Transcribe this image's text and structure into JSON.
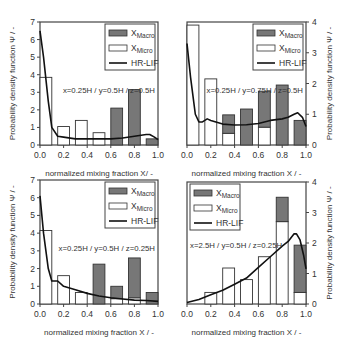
{
  "chart_data": [
    {
      "type": "bar",
      "panel": "top-left",
      "annotation": "x=0.25H / y=0.5H / z=0.5H",
      "xlabel": "normalized mixing fraction X/ -",
      "ylabel": "Probability density function Ψ / -",
      "y_axis_side": "left",
      "xlim": [
        0,
        1
      ],
      "ylim": [
        0,
        7
      ],
      "xticks": [
        "0.0",
        "0.2",
        "0.4",
        "0.6",
        "0.8",
        "1.0"
      ],
      "yticks": [
        "0",
        "1",
        "2",
        "3",
        "4",
        "5",
        "6",
        "7"
      ],
      "legend": [
        "XMacro",
        "XMicro",
        "HR-LIF"
      ],
      "legend_position": "top-right",
      "bin_centers": [
        0.05,
        0.2,
        0.35,
        0.5,
        0.65,
        0.8,
        0.95
      ],
      "series": [
        {
          "name": "XMicro",
          "values": [
            3.85,
            1.05,
            1.4,
            0.7,
            0,
            0,
            0
          ]
        },
        {
          "name": "XMacro",
          "values": [
            0,
            0,
            0,
            0,
            2.1,
            3.15,
            0.35
          ]
        },
        {
          "name": "HR-LIF",
          "x": [
            0,
            0.03,
            0.07,
            0.1,
            0.15,
            0.2,
            0.3,
            0.4,
            0.5,
            0.6,
            0.7,
            0.8,
            0.9,
            0.93,
            0.97,
            1.0
          ],
          "values": [
            6.5,
            5.0,
            2.5,
            1.0,
            0.5,
            0.45,
            0.35,
            0.35,
            0.35,
            0.35,
            0.4,
            0.5,
            0.6,
            0.6,
            0.45,
            0.3
          ]
        }
      ]
    },
    {
      "type": "bar",
      "panel": "top-right",
      "annotation": "x=0.25H / y=0.75H / z=0.5H",
      "xlabel": "normalized mixing fraction X / -",
      "ylabel": "Probability density function Ψ / -",
      "y_axis_side": "right",
      "xlim": [
        0,
        1
      ],
      "ylim": [
        0,
        4
      ],
      "xticks": [
        "0.0",
        "0.2",
        "0.4",
        "0.6",
        "0.8",
        "1.0"
      ],
      "yticks": [
        "0",
        "1",
        "2",
        "3",
        "4"
      ],
      "legend": [
        "XMacro",
        "XMicro",
        "HR-LIF"
      ],
      "legend_position": "top-right",
      "bin_centers": [
        0.05,
        0.2,
        0.35,
        0.5,
        0.65,
        0.8,
        0.95
      ],
      "series": [
        {
          "name": "XMicro",
          "values": [
            3.9,
            2.15,
            0.38,
            0,
            0.58,
            0,
            0
          ]
        },
        {
          "name": "XMacro",
          "values": [
            0,
            0,
            0.6,
            1.17,
            1.17,
            1.95,
            0.8
          ]
        },
        {
          "name": "HR-LIF",
          "x": [
            0,
            0.03,
            0.07,
            0.1,
            0.13,
            0.17,
            0.2,
            0.3,
            0.4,
            0.5,
            0.6,
            0.7,
            0.8,
            0.85,
            0.9,
            0.93,
            0.97,
            1.0
          ],
          "values": [
            3.3,
            2.2,
            1.0,
            0.75,
            0.75,
            0.85,
            0.8,
            0.68,
            0.65,
            0.66,
            0.7,
            0.8,
            0.85,
            0.9,
            1.0,
            1.05,
            0.9,
            0.6
          ]
        }
      ]
    },
    {
      "type": "bar",
      "panel": "bottom-left",
      "annotation": "x=0.25H / y=0.5H / z=0.25H",
      "xlabel": "normalized mixing fraction X / -",
      "ylabel": "Probability density function Ψ / -",
      "y_axis_side": "left",
      "xlim": [
        0,
        1
      ],
      "ylim": [
        0,
        7
      ],
      "xticks": [
        "0.0",
        "0.2",
        "0.4",
        "0.6",
        "0.8",
        "1.0"
      ],
      "yticks": [
        "0",
        "1",
        "2",
        "3",
        "4",
        "5",
        "6",
        "7"
      ],
      "legend": [
        "XMacro",
        "XMicro",
        "HR-LIF"
      ],
      "legend_position": "top-right",
      "bin_centers": [
        0.05,
        0.2,
        0.35,
        0.5,
        0.65,
        0.8,
        0.95
      ],
      "series": [
        {
          "name": "XMicro",
          "values": [
            4.15,
            1.6,
            0.65,
            0,
            0.3,
            0.35,
            0
          ]
        },
        {
          "name": "XMacro",
          "values": [
            0,
            0,
            0,
            2.25,
            0.7,
            2.25,
            0.65
          ]
        },
        {
          "name": "HR-LIF",
          "x": [
            0,
            0.03,
            0.07,
            0.1,
            0.15,
            0.2,
            0.3,
            0.4,
            0.5,
            0.6,
            0.7,
            0.8,
            0.9,
            1.0
          ],
          "values": [
            6.1,
            4.0,
            2.0,
            1.3,
            1.3,
            1.0,
            0.8,
            0.6,
            0.45,
            0.35,
            0.28,
            0.22,
            0.2,
            0.15
          ]
        }
      ]
    },
    {
      "type": "bar",
      "panel": "bottom-right",
      "annotation": "x=2.5H / y=0.5H / z=0.25H",
      "xlabel": "normalized mixing fraction X / -",
      "ylabel": "Probability density function Ψ / -",
      "y_axis_side": "right",
      "xlim": [
        0,
        1
      ],
      "ylim": [
        0,
        4
      ],
      "xticks": [
        "0.0",
        "0.2",
        "0.4",
        "0.6",
        "0.8",
        "1.0"
      ],
      "yticks": [
        "0",
        "1",
        "2",
        "3",
        "4"
      ],
      "legend": [
        "XMacro",
        "XMicro",
        "HR-LIF"
      ],
      "legend_position": "top-left",
      "bin_centers": [
        0.05,
        0.2,
        0.35,
        0.5,
        0.65,
        0.8,
        0.95
      ],
      "series": [
        {
          "name": "XMicro",
          "values": [
            0,
            0.38,
            1.18,
            0.8,
            1.55,
            2.7,
            0.38
          ]
        },
        {
          "name": "XMacro",
          "values": [
            0,
            0,
            0,
            0,
            0,
            0.8,
            1.55
          ]
        },
        {
          "name": "HR-LIF",
          "x": [
            0,
            0.1,
            0.2,
            0.3,
            0.4,
            0.5,
            0.6,
            0.7,
            0.8,
            0.85,
            0.9,
            0.92,
            0.95,
            0.98,
            1.0
          ],
          "values": [
            0.05,
            0.15,
            0.3,
            0.45,
            0.65,
            0.85,
            1.2,
            1.55,
            1.9,
            2.05,
            2.3,
            2.3,
            2.1,
            1.6,
            1.15
          ]
        }
      ]
    }
  ]
}
